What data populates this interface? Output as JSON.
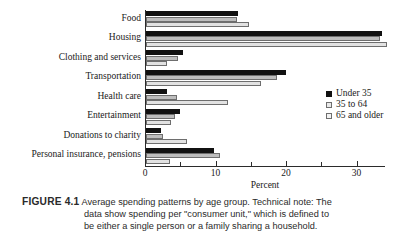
{
  "chart_data": {
    "type": "bar",
    "orientation": "horizontal",
    "title": "Average spending patterns by age group",
    "xlabel": "Percent",
    "ylabel": "",
    "xlim": [
      0,
      35
    ],
    "xticks": [
      0,
      10,
      20,
      30
    ],
    "xtick_labels": [
      "0",
      "10",
      "20",
      "30"
    ],
    "xminor_ticks": [
      5,
      15,
      25
    ],
    "grid": false,
    "legend_position": "right-middle",
    "categories": [
      "Food",
      "Housing",
      "Clothing and services",
      "Transportation",
      "Health care",
      "Entertainment",
      "Donations to charity",
      "Personal insurance, pensions"
    ],
    "series": [
      {
        "name": "Under 35",
        "color": "#111111",
        "values": [
          13.0,
          33.5,
          5.2,
          19.9,
          3.0,
          4.8,
          2.1,
          9.6
        ]
      },
      {
        "name": "35 to 64",
        "color": "#bdbdbd",
        "values": [
          12.9,
          33.2,
          4.5,
          18.6,
          4.4,
          4.1,
          2.4,
          10.5
        ]
      },
      {
        "name": "65 and older",
        "color": "#e2e2e2",
        "values": [
          14.6,
          34.2,
          3.0,
          16.3,
          11.6,
          3.6,
          5.8,
          3.4
        ]
      }
    ]
  },
  "figure": {
    "label": "FIGURE 4.1",
    "caption_line1": "Average spending patterns by age group. Technical note: The",
    "caption_line2": "data show spending per \"consumer unit,\" which is defined to",
    "caption_line3": "be either a single person or a family sharing a household."
  },
  "top_bleed_text": ""
}
